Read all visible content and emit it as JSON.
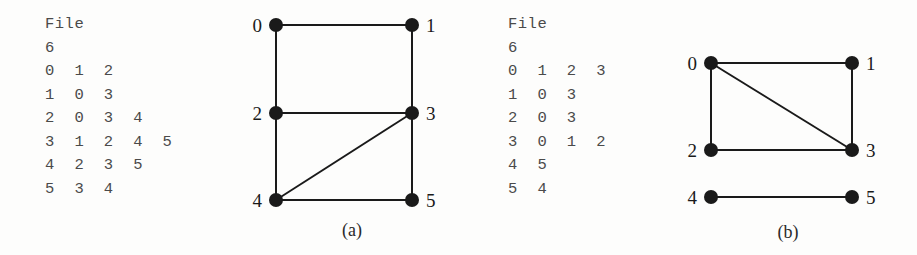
{
  "figure": {
    "background_color": "#fdfdfc",
    "ink_color": "#1a1a1a",
    "text_color": "#4a4a4a"
  },
  "panels": [
    {
      "id": "a",
      "caption": "(a)",
      "file_listing": {
        "title": "File",
        "lines": [
          "File",
          "6",
          "0  1  2",
          "1  0  3",
          "2  0  3  4",
          "3  1  2  4  5",
          "4  2  3  5",
          "5  3  4"
        ],
        "vertex_count": "6",
        "adjacency": [
          {
            "vertex": "0",
            "neighbors": [
              "1",
              "2"
            ]
          },
          {
            "vertex": "1",
            "neighbors": [
              "0",
              "3"
            ]
          },
          {
            "vertex": "2",
            "neighbors": [
              "0",
              "3",
              "4"
            ]
          },
          {
            "vertex": "3",
            "neighbors": [
              "1",
              "2",
              "4",
              "5"
            ]
          },
          {
            "vertex": "4",
            "neighbors": [
              "2",
              "3",
              "5"
            ]
          },
          {
            "vertex": "5",
            "neighbors": [
              "3",
              "4"
            ]
          }
        ]
      },
      "graph": {
        "nodes": [
          {
            "id": "0",
            "label": "0",
            "x": 46,
            "y": 25,
            "label_side": "left"
          },
          {
            "id": "1",
            "label": "1",
            "x": 182,
            "y": 25,
            "label_side": "right"
          },
          {
            "id": "2",
            "label": "2",
            "x": 46,
            "y": 113,
            "label_side": "left"
          },
          {
            "id": "3",
            "label": "3",
            "x": 182,
            "y": 113,
            "label_side": "right"
          },
          {
            "id": "4",
            "label": "4",
            "x": 46,
            "y": 200,
            "label_side": "left"
          },
          {
            "id": "5",
            "label": "5",
            "x": 182,
            "y": 200,
            "label_side": "right"
          }
        ],
        "edges": [
          [
            "0",
            "1"
          ],
          [
            "0",
            "2"
          ],
          [
            "1",
            "3"
          ],
          [
            "2",
            "3"
          ],
          [
            "2",
            "4"
          ],
          [
            "3",
            "5"
          ],
          [
            "3",
            "4"
          ],
          [
            "4",
            "5"
          ]
        ]
      }
    },
    {
      "id": "b",
      "caption": "(b)",
      "file_listing": {
        "title": "File",
        "lines": [
          "File",
          "6",
          "0  1  2  3",
          "1  0  3",
          "2  0  3",
          "3  0  1  2",
          "4  5",
          "5  4"
        ],
        "vertex_count": "6",
        "adjacency": [
          {
            "vertex": "0",
            "neighbors": [
              "1",
              "2",
              "3"
            ]
          },
          {
            "vertex": "1",
            "neighbors": [
              "0",
              "3"
            ]
          },
          {
            "vertex": "2",
            "neighbors": [
              "0",
              "3"
            ]
          },
          {
            "vertex": "3",
            "neighbors": [
              "0",
              "1",
              "2"
            ]
          },
          {
            "vertex": "4",
            "neighbors": [
              "5"
            ]
          },
          {
            "vertex": "5",
            "neighbors": [
              "4"
            ]
          }
        ]
      },
      "graph": {
        "nodes": [
          {
            "id": "0",
            "label": "0",
            "x": 51,
            "y": 63,
            "label_side": "left"
          },
          {
            "id": "1",
            "label": "1",
            "x": 192,
            "y": 63,
            "label_side": "right"
          },
          {
            "id": "2",
            "label": "2",
            "x": 51,
            "y": 150,
            "label_side": "left"
          },
          {
            "id": "3",
            "label": "3",
            "x": 192,
            "y": 150,
            "label_side": "right"
          },
          {
            "id": "4",
            "label": "4",
            "x": 51,
            "y": 197,
            "label_side": "left"
          },
          {
            "id": "5",
            "label": "5",
            "x": 192,
            "y": 197,
            "label_side": "right"
          }
        ],
        "edges": [
          [
            "0",
            "1"
          ],
          [
            "0",
            "2"
          ],
          [
            "0",
            "3"
          ],
          [
            "1",
            "3"
          ],
          [
            "2",
            "3"
          ],
          [
            "4",
            "5"
          ]
        ]
      }
    }
  ]
}
